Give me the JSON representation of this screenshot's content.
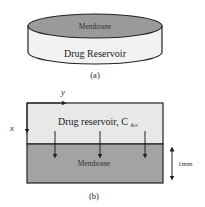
{
  "figure_a": {
    "top_label": "Membrane",
    "body_label": "Drug Reservoir",
    "caption": "(a)",
    "colors": {
      "membrane": "#9a9a9a",
      "reservoir": "#f0f0f0",
      "stroke": "#222222"
    }
  },
  "figure_b": {
    "axis_y_label": "y",
    "axis_x_label": "x",
    "reservoir_label": "Drug reservoir, C",
    "reservoir_subscript": "A∞",
    "membrane_label": "Membrane",
    "thickness_label": "1mm",
    "caption": "(b)",
    "flux_arrow_count": 3,
    "colors": {
      "membrane": "#a3a3a3",
      "reservoir": "#e6e6e6",
      "stroke": "#222222"
    }
  }
}
